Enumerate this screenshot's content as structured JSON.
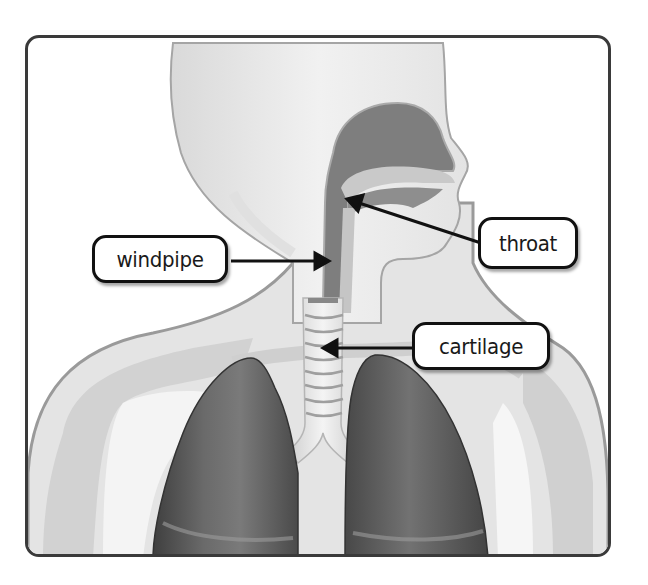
{
  "diagram": {
    "labels": [
      {
        "id": "windpipe",
        "text": "windpipe"
      },
      {
        "id": "throat",
        "text": "throat"
      },
      {
        "id": "cartilage",
        "text": "cartilage"
      }
    ],
    "colors": {
      "frame": "#3a3a3a",
      "skin_light": "#ebebeb",
      "skin_mid": "#d6d6d6",
      "skin_outline": "#9a9a9a",
      "airway": "#7c7c7c",
      "lungs": "#5e5e5e",
      "trachea": "#e2e2e2",
      "arrow": "#111111"
    }
  }
}
